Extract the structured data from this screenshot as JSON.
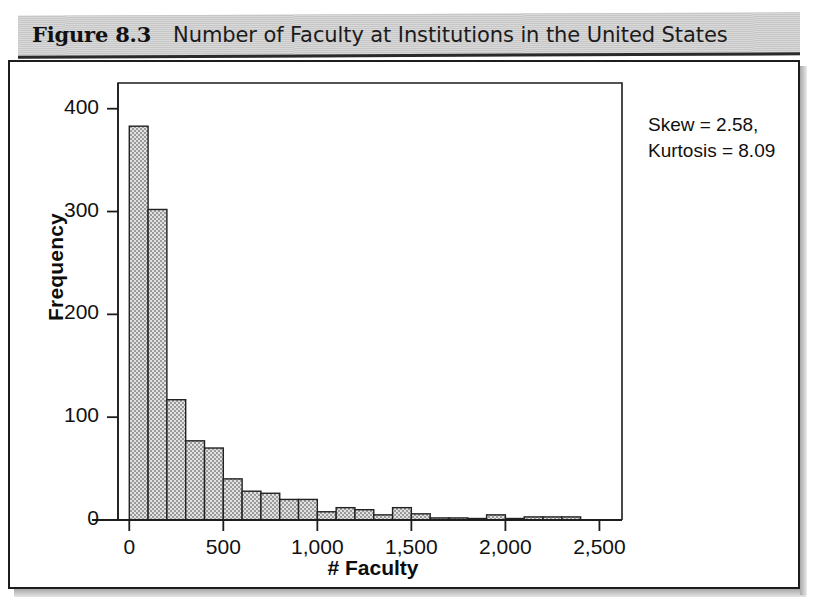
{
  "figure": {
    "label": "Figure 8.3",
    "title": "Number of Faculty at Institutions in the United States"
  },
  "annotation": {
    "line1": "Skew = 2.58,",
    "line2": "Kurtosis = 8.09"
  },
  "colors": {
    "bar_fill": "#b3b3b3",
    "bar_edge": "#222222",
    "axis": "#1d1d1d",
    "text": "#101010",
    "caption_band": "#d2d2d2"
  },
  "chart_data": {
    "type": "bar",
    "title": "Number of Faculty at Institutions in the United States",
    "xlabel": "# Faculty",
    "ylabel": "Frequency",
    "xlim": [
      -60,
      2620
    ],
    "ylim": [
      0,
      425
    ],
    "grid": false,
    "legend": null,
    "bin_width": 100,
    "xticks": [
      0,
      500,
      1000,
      1500,
      2000,
      2500
    ],
    "xtick_labels": [
      "0",
      "500",
      "1,000",
      "1,500",
      "2,000",
      "2,500"
    ],
    "yticks": [
      0,
      100,
      200,
      300,
      400
    ],
    "ytick_labels": [
      "0",
      "100",
      "200",
      "300",
      "400"
    ],
    "bin_starts": [
      0,
      100,
      200,
      300,
      400,
      500,
      600,
      700,
      800,
      900,
      1000,
      1100,
      1200,
      1300,
      1400,
      1500,
      1600,
      1700,
      1800,
      1900,
      2000,
      2100,
      2200,
      2300
    ],
    "categories": [
      "0-100",
      "100-200",
      "200-300",
      "300-400",
      "400-500",
      "500-600",
      "600-700",
      "700-800",
      "800-900",
      "900-1000",
      "1000-1100",
      "1100-1200",
      "1200-1300",
      "1300-1400",
      "1400-1500",
      "1500-1600",
      "1600-1700",
      "1700-1800",
      "1800-1900",
      "1900-2000",
      "2000-2100",
      "2100-2200",
      "2200-2300",
      "2300-2400"
    ],
    "values": [
      383,
      302,
      117,
      77,
      70,
      40,
      28,
      26,
      20,
      20,
      8,
      12,
      10,
      5,
      12,
      6,
      2,
      2,
      1,
      5,
      1,
      3,
      3,
      3
    ],
    "annotations": [
      "Skew = 2.58,",
      "Kurtosis = 8.09"
    ]
  }
}
